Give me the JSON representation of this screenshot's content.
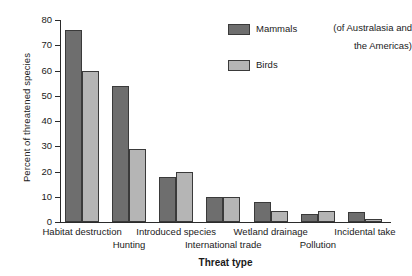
{
  "chart_data": {
    "type": "bar",
    "title": "",
    "xlabel": "Threat type",
    "ylabel": "Percent of threatened species",
    "ylim": [
      0,
      80
    ],
    "yticks": [
      0,
      10,
      20,
      30,
      40,
      50,
      60,
      70,
      80
    ],
    "grid": false,
    "legend_position": "top-right",
    "legend_note": "(of Australasia and the Americas)",
    "categories": [
      "Habitat destruction",
      "Hunting",
      "Introduced species",
      "International trade",
      "Wetland drainage",
      "Pollution",
      "Incidental take"
    ],
    "series": [
      {
        "name": "Mammals",
        "color": "#6e6e6e",
        "values": [
          76,
          54,
          18,
          10,
          8,
          3,
          4
        ]
      },
      {
        "name": "Birds",
        "color": "#b5b5b5",
        "values": [
          60,
          29,
          20,
          10,
          4.5,
          4.5,
          1
        ]
      }
    ]
  },
  "axis": {
    "y_title": "Percent of threatened species",
    "x_title": "Threat type",
    "y_tick_labels": [
      "0",
      "10",
      "20",
      "30",
      "40",
      "50",
      "60",
      "70",
      "80"
    ]
  },
  "x_labels_row1": [
    {
      "text": "Habitat destruction"
    },
    {
      "text": "Introduced species"
    },
    {
      "text": "Wetland drainage"
    },
    {
      "text": "Incidental take"
    }
  ],
  "x_labels_row2": [
    {
      "text": "Hunting"
    },
    {
      "text": "International trade"
    },
    {
      "text": "Pollution"
    }
  ],
  "legend": {
    "items": [
      {
        "label": "Mammals",
        "color": "#6e6e6e"
      },
      {
        "label": "Birds",
        "color": "#b5b5b5"
      }
    ],
    "note_line1": "(of Australasia and",
    "note_line2": "the Americas)"
  }
}
